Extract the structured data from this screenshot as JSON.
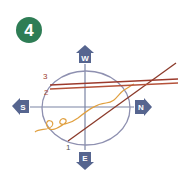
{
  "step_badge": {
    "number": "4",
    "color": "#2e7d55"
  },
  "compass": {
    "west": {
      "label": "W"
    },
    "south": {
      "label": "S"
    },
    "north": {
      "label": "N"
    },
    "east": {
      "label": "E"
    },
    "marker_color": "#56658f",
    "axis_color": "#7a84a3",
    "circle_color": "#8e90b0"
  },
  "lines": [
    {
      "label": "1",
      "color": "#8b3a2a"
    },
    {
      "label": "2",
      "color": "#b5523a"
    },
    {
      "label": "3",
      "color": "#9c3a2c"
    }
  ],
  "squiggle": {
    "color": "#e0a040"
  }
}
